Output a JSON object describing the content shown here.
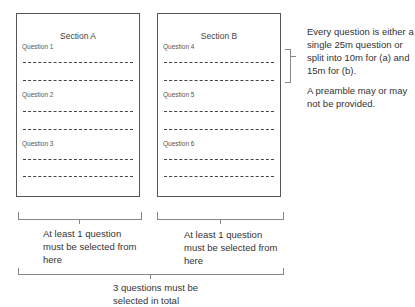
{
  "sections": [
    {
      "title": "Section A",
      "questions": [
        {
          "label": "Question 1"
        },
        {
          "label": "Question 2"
        },
        {
          "label": "Question 3"
        }
      ]
    },
    {
      "title": "Section B",
      "questions": [
        {
          "label": "Question 4"
        },
        {
          "label": "Question 5"
        },
        {
          "label": "Question 6"
        }
      ]
    }
  ],
  "notes": {
    "question_format": "Every question is either a single 25m question or split into 10m for (a) and 15m for (b).",
    "preamble": "A preamble may or may not be provided."
  },
  "constraints": {
    "section_a": "At least 1 question must be selected from here",
    "section_b": "At least 1 question must be selected from here",
    "total": "3 questions must be selected in total"
  }
}
